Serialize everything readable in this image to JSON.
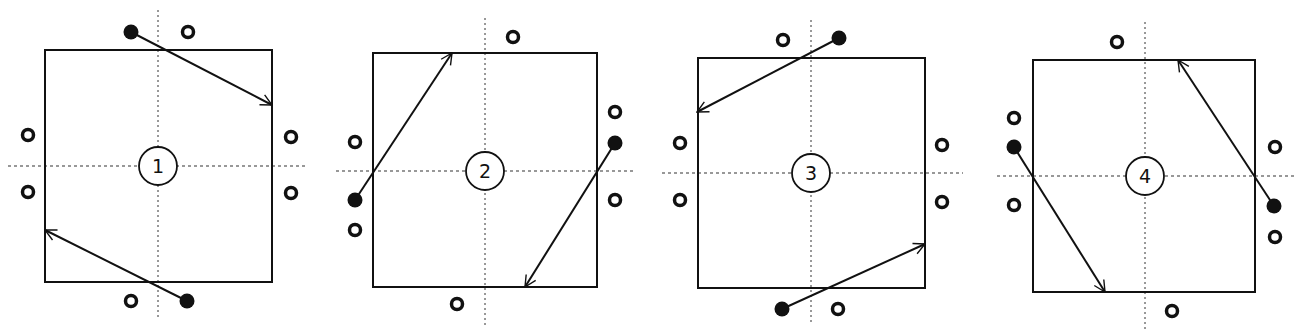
{
  "figure": {
    "colors": {
      "stroke": "#111111",
      "background": "#ffffff",
      "dashed": "#333333"
    },
    "panels": [
      {
        "label": "1",
        "box": {
          "x1": 45,
          "y1": 50,
          "x2": 272,
          "y2": 282
        },
        "center": {
          "x": 158,
          "y": 166
        },
        "vline": {
          "y1": 10,
          "y2": 320
        },
        "hline": {
          "x1": 8,
          "x2": 308
        },
        "arrows": [
          {
            "from": [
              131,
              32
            ],
            "to": [
              272,
              105
            ]
          },
          {
            "from": [
              187,
              301
            ],
            "to": [
              45,
              230
            ]
          }
        ],
        "open_markers": [
          [
            188,
            32
          ],
          [
            28,
            135
          ],
          [
            28,
            192
          ],
          [
            291,
            137
          ],
          [
            291,
            193
          ],
          [
            131,
            301
          ]
        ]
      },
      {
        "label": "2",
        "box": {
          "x1": 373,
          "y1": 53,
          "x2": 597,
          "y2": 287
        },
        "center": {
          "x": 485,
          "y": 171
        },
        "vline": {
          "y1": 18,
          "y2": 325
        },
        "hline": {
          "x1": 336,
          "x2": 635
        },
        "arrows": [
          {
            "from": [
              355,
              200
            ],
            "to": [
              452,
              53
            ]
          },
          {
            "from": [
              615,
              143
            ],
            "to": [
              525,
              287
            ]
          }
        ],
        "open_markers": [
          [
            513,
            37
          ],
          [
            355,
            142
          ],
          [
            355,
            230
          ],
          [
            615,
            112
          ],
          [
            615,
            200
          ],
          [
            457,
            304
          ]
        ]
      },
      {
        "label": "3",
        "box": {
          "x1": 698,
          "y1": 58,
          "x2": 925,
          "y2": 288
        },
        "center": {
          "x": 811,
          "y": 173
        },
        "vline": {
          "y1": 20,
          "y2": 325
        },
        "hline": {
          "x1": 662,
          "x2": 963
        },
        "arrows": [
          {
            "from": [
              839,
              38
            ],
            "to": [
              697,
              112
            ]
          },
          {
            "from": [
              782,
              309
            ],
            "to": [
              925,
              244
            ]
          }
        ],
        "open_markers": [
          [
            783,
            40
          ],
          [
            680,
            143
          ],
          [
            680,
            200
          ],
          [
            942,
            145
          ],
          [
            942,
            202
          ],
          [
            838,
            309
          ]
        ]
      },
      {
        "label": "4",
        "box": {
          "x1": 1033,
          "y1": 60,
          "x2": 1255,
          "y2": 292
        },
        "center": {
          "x": 1145,
          "y": 176
        },
        "vline": {
          "y1": 22,
          "y2": 330
        },
        "hline": {
          "x1": 997,
          "x2": 1295
        },
        "arrows": [
          {
            "from": [
              1014,
              147
            ],
            "to": [
              1105,
              292
            ]
          },
          {
            "from": [
              1274,
              206
            ],
            "to": [
              1178,
              60
            ]
          }
        ],
        "open_markers": [
          [
            1117,
            42
          ],
          [
            1014,
            118
          ],
          [
            1014,
            205
          ],
          [
            1275,
            147
          ],
          [
            1275,
            237
          ],
          [
            1172,
            311
          ]
        ]
      }
    ]
  }
}
